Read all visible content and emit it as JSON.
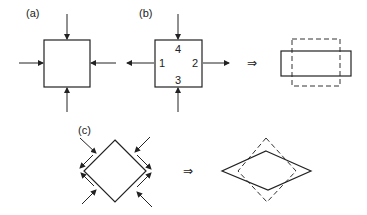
{
  "panels": {
    "a": {
      "label": "(a)"
    },
    "b": {
      "label": "(b)",
      "face_numbers": [
        "1",
        "2",
        "3",
        "4"
      ]
    },
    "c": {
      "label": "(c)"
    }
  },
  "implies_symbol": "⇒",
  "colors": {
    "stroke": "#222222",
    "background": "#ffffff"
  }
}
